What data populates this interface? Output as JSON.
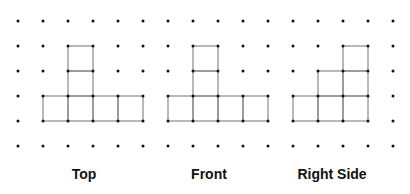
{
  "grid": {
    "dot_color": "#111111",
    "line_color": "#8a8a8a",
    "x0": 18,
    "y0": 21,
    "spacing": 25,
    "cols": 16,
    "rows": 6
  },
  "views": [
    {
      "id": "top",
      "label": "Top",
      "label_x": 84,
      "cells": [
        [
          2,
          1
        ],
        [
          2,
          2
        ],
        [
          1,
          3
        ],
        [
          2,
          3
        ],
        [
          3,
          3
        ],
        [
          4,
          3
        ]
      ]
    },
    {
      "id": "front",
      "label": "Front",
      "label_x": 209,
      "cells": [
        [
          7,
          1
        ],
        [
          7,
          2
        ],
        [
          6,
          3
        ],
        [
          7,
          3
        ],
        [
          8,
          3
        ],
        [
          9,
          3
        ]
      ]
    },
    {
      "id": "right-side",
      "label": "Right Side",
      "label_x": 332,
      "cells": [
        [
          13,
          1
        ],
        [
          12,
          2
        ],
        [
          13,
          2
        ],
        [
          11,
          3
        ],
        [
          12,
          3
        ],
        [
          13,
          3
        ]
      ]
    }
  ]
}
